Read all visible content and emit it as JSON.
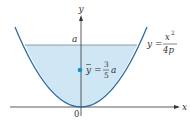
{
  "diagram": {
    "axes": {
      "x_label": "x",
      "y_label": "y",
      "origin_label": "0"
    },
    "level_label": "a",
    "curve": {
      "lhs": "y =",
      "numerator": "x",
      "numerator_exp": "2",
      "denominator": "4p"
    },
    "centroid": {
      "symbol": "y",
      "equals": "=",
      "frac_num": "3",
      "frac_den": "5",
      "suffix": "a"
    },
    "colors": {
      "curve": "#2e6da4",
      "fill": "#cfe6f5",
      "axis": "#333333",
      "waterline": "#7a8590",
      "dot": "#1a8fd0"
    }
  }
}
